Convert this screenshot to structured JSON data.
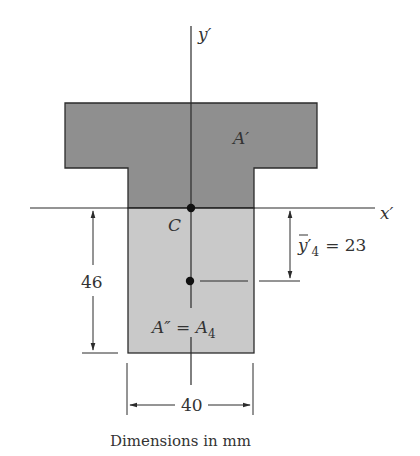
{
  "diagram": {
    "type": "composite-section-centroid",
    "labels": {
      "y_axis": "y′",
      "x_axis": "x′",
      "centroid": "C",
      "upper_area": "A′",
      "lower_area_left": "A″ = A",
      "lower_area_sub": "4",
      "ybar_main": "y",
      "ybar_prime": "′",
      "ybar_sub": "4",
      "ybar_value": "= 23",
      "height_dim": "46",
      "width_dim": "40",
      "caption": "Dimensions in mm"
    },
    "dimensions_mm": {
      "lower_height": 46,
      "lower_width": 40,
      "ybar_4": 23
    },
    "colors": {
      "upper_fill": "#8f8f8f",
      "lower_fill": "#c9c9c9",
      "stroke": "#2b2b2b",
      "text": "#333333"
    }
  }
}
